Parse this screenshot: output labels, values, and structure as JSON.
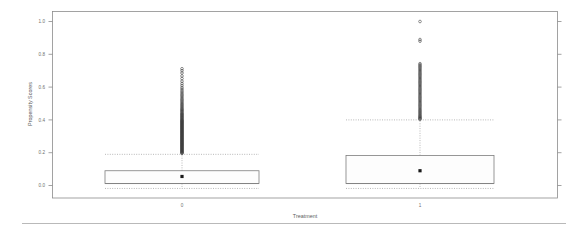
{
  "chart_data": {
    "type": "boxplot",
    "title": "",
    "subtitle": "",
    "xlabel": "Treatment",
    "ylabel": "Propensity Scores",
    "categories": [
      "0",
      "1"
    ],
    "xtick_labels": [
      "0",
      "1"
    ],
    "ytick_labels": [
      "1.0",
      "0.8",
      "0.6",
      "0.4",
      "0.2",
      "0.0"
    ],
    "ytick_values": [
      1.0,
      0.8,
      0.6,
      0.4,
      0.2,
      0.0
    ],
    "ylim": [
      -0.04,
      1.06
    ],
    "grid": false,
    "legend": null,
    "box_style": "dashed-whiskers, mean marker shown as filled square",
    "series": [
      {
        "name": "0",
        "category": "0",
        "n_label": "",
        "q1": 0.012,
        "median": 0.012,
        "q3": 0.09,
        "mean": 0.055,
        "whisker_low": -0.018,
        "whisker_high": 0.19,
        "outliers": [
          0.196,
          0.199,
          0.202,
          0.205,
          0.208,
          0.211,
          0.214,
          0.217,
          0.22,
          0.223,
          0.226,
          0.229,
          0.232,
          0.235,
          0.238,
          0.241,
          0.244,
          0.247,
          0.25,
          0.253,
          0.256,
          0.259,
          0.262,
          0.265,
          0.268,
          0.271,
          0.274,
          0.277,
          0.28,
          0.283,
          0.286,
          0.289,
          0.292,
          0.295,
          0.298,
          0.301,
          0.304,
          0.307,
          0.31,
          0.313,
          0.316,
          0.319,
          0.322,
          0.325,
          0.328,
          0.331,
          0.334,
          0.337,
          0.34,
          0.343,
          0.346,
          0.349,
          0.352,
          0.355,
          0.358,
          0.361,
          0.364,
          0.367,
          0.37,
          0.373,
          0.376,
          0.379,
          0.382,
          0.385,
          0.388,
          0.391,
          0.394,
          0.397,
          0.4,
          0.404,
          0.408,
          0.412,
          0.416,
          0.42,
          0.424,
          0.428,
          0.432,
          0.436,
          0.44,
          0.445,
          0.45,
          0.455,
          0.46,
          0.465,
          0.47,
          0.476,
          0.482,
          0.488,
          0.494,
          0.5,
          0.507,
          0.514,
          0.521,
          0.528,
          0.536,
          0.544,
          0.552,
          0.56,
          0.569,
          0.578,
          0.588,
          0.598,
          0.61,
          0.622,
          0.636,
          0.652,
          0.668,
          0.686,
          0.7,
          0.712
        ]
      },
      {
        "name": "1",
        "category": "1",
        "n_label": "",
        "q1": 0.012,
        "median": 0.012,
        "q3": 0.183,
        "mean": 0.09,
        "whisker_low": -0.018,
        "whisker_high": 0.4,
        "outliers": [
          0.404,
          0.408,
          0.412,
          0.417,
          0.422,
          0.427,
          0.433,
          0.439,
          0.445,
          0.451,
          0.457,
          0.463,
          0.47,
          0.477,
          0.484,
          0.491,
          0.498,
          0.505,
          0.512,
          0.519,
          0.526,
          0.533,
          0.54,
          0.547,
          0.554,
          0.561,
          0.568,
          0.575,
          0.582,
          0.589,
          0.596,
          0.603,
          0.61,
          0.617,
          0.624,
          0.631,
          0.638,
          0.645,
          0.652,
          0.659,
          0.666,
          0.673,
          0.68,
          0.687,
          0.694,
          0.701,
          0.708,
          0.715,
          0.722,
          0.729,
          0.736,
          0.743,
          0.88,
          0.89,
          1.0
        ]
      }
    ],
    "colors": {
      "frame": "#8c8c8c",
      "box_stroke": "#7d7d7d",
      "box_fill": "#fdfdfd",
      "whisker": "#9a9a9a",
      "mean_marker": "#1a1a1a",
      "outlier": "#3a3a3a",
      "text": "#6e6e6e",
      "rule": "#b9b9b9"
    }
  }
}
